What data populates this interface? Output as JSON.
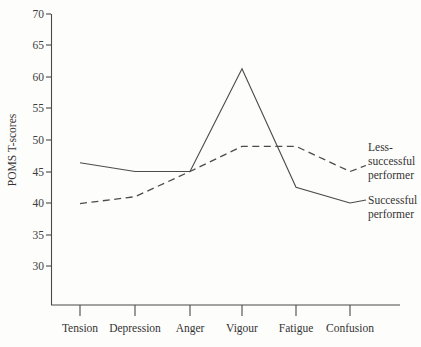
{
  "chart_data": {
    "type": "line",
    "title": "",
    "subtitle": "",
    "xlabel": "",
    "ylabel": "POMS T-scores",
    "categories": [
      "Tension",
      "Depression",
      "Anger",
      "Vigour",
      "Fatigue",
      "Confusion"
    ],
    "yticks": [
      30,
      35,
      40,
      45,
      50,
      55,
      60,
      65,
      70
    ],
    "ylim": [
      27,
      70
    ],
    "grid": false,
    "legend_position": "right-inline",
    "series": [
      {
        "name": "Successful performer",
        "style": "solid",
        "label_lines": [
          "Successful",
          "performer"
        ],
        "values": [
          46.4,
          45.0,
          45.0,
          61.3,
          42.5,
          40.0
        ]
      },
      {
        "name": "Less-successful performer",
        "style": "dashed",
        "label_lines": [
          "Less-",
          "successful",
          "performer"
        ],
        "values": [
          39.9,
          41.0,
          45.0,
          49.0,
          49.0,
          45.0
        ]
      }
    ],
    "colors": {
      "line": "#4c4c4c",
      "axis": "#4a4a4a",
      "text": "#343434",
      "background": "#fdfdfb"
    }
  }
}
